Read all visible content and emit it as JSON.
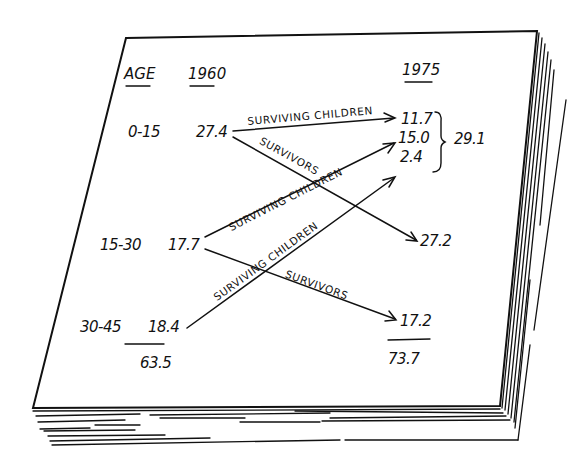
{
  "diagram": {
    "type": "population-flow-on-paper-stack",
    "headers": {
      "age": "AGE",
      "year_start": "1960",
      "year_end": "1975"
    },
    "rows": [
      {
        "age": "0-15",
        "value_1960": "27.4"
      },
      {
        "age": "15-30",
        "value_1960": "17.7"
      },
      {
        "age": "30-45",
        "value_1960": "18.4"
      }
    ],
    "total_1960": "63.5",
    "values_1975": [
      "11.7",
      "15.0",
      "2.4",
      "27.2",
      "17.2"
    ],
    "bracket_total_1975": "29.1",
    "total_1975": "73.7",
    "flows": [
      {
        "from": "27.4",
        "to": "11.7",
        "label": "SURVIVING CHILDREN"
      },
      {
        "from": "27.4",
        "to": "27.2",
        "label": "SURVIVORS"
      },
      {
        "from": "17.7",
        "to": "15.0",
        "label": "SURVIVING CHILDREN"
      },
      {
        "from": "17.7",
        "to": "17.2",
        "label": "SURVIVORS"
      },
      {
        "from": "18.4",
        "to": "2.4",
        "label": "SURVIVING CHILDREN"
      }
    ]
  }
}
